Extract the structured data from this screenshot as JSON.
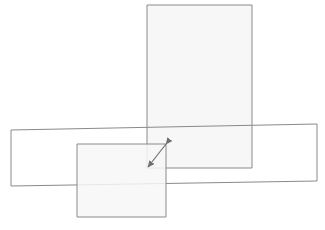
{
  "canvas": {
    "width": 325,
    "height": 230,
    "background_color": "#ffffff",
    "title": ""
  },
  "style": {
    "stroke_color": "#8a8a8a",
    "stroke_color_dark": "#707070",
    "fill_color": "#f7f7f7",
    "fill_color_plain": "#ffffff",
    "stroke_width": 1,
    "arrow_color": "#6f6f6f"
  },
  "shapes": [
    {
      "id": "tall-rectangle",
      "name": "tall-rectangle",
      "kind": "rectangle",
      "orientation": "portrait",
      "points": "147,5 252,5 252,168 147,168",
      "fill": "#f7f7f7",
      "stroke": "#8a8a8a",
      "z": 1,
      "label": ""
    },
    {
      "id": "wide-rectangle",
      "name": "wide-rectangle",
      "kind": "rectangle",
      "orientation": "landscape-slanted",
      "points": "11,130 317,124 317,181 11,186",
      "fill": "#ffffff",
      "stroke": "#8a8a8a",
      "z": 2,
      "label": ""
    },
    {
      "id": "small-square",
      "name": "small-square",
      "kind": "rectangle",
      "orientation": "square",
      "points": "77,144 166,144 166,217 77,217",
      "fill": "#f7f7f7",
      "stroke": "#8a8a8a",
      "z": 3,
      "label": ""
    }
  ],
  "annotations": [
    {
      "id": "double-arrow",
      "name": "double-headed-arrow",
      "kind": "arrow",
      "heads": "both",
      "from": {
        "x": 166,
        "y": 144
      },
      "to": {
        "x": 148,
        "y": 167
      },
      "color": "#6f6f6f",
      "label": ""
    }
  ],
  "legend": {
    "visible": false,
    "entries": []
  },
  "axes": {
    "visible": false,
    "x_ticks": [],
    "y_ticks": []
  }
}
